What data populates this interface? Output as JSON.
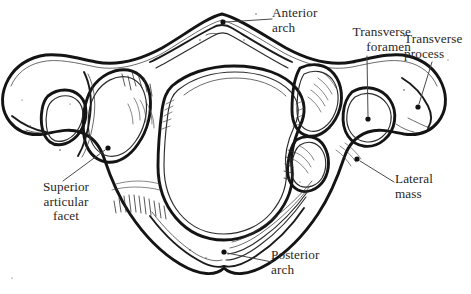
{
  "figure": {
    "background_color": "#ffffff",
    "ink_color": "#141414",
    "label_color": "#2a2728",
    "leader_color": "#3f3f41"
  },
  "labels": {
    "anterior_arch": {
      "line1": "Anterior",
      "line2": "arch"
    },
    "transverse_foramen": {
      "line1": "Transverse",
      "line2": "foramen"
    },
    "transverse_process": {
      "line1": "Transverse",
      "line2": "process"
    },
    "superior_articular_facet": {
      "line1": "Superior",
      "line2": "articular",
      "line3": "facet"
    },
    "lateral_mass": {
      "line1": "Lateral",
      "line2": "mass"
    },
    "posterior_arch": {
      "line1": "Posterior",
      "line2": "arch"
    }
  }
}
